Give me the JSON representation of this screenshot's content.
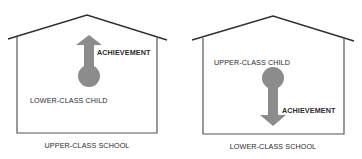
{
  "panels": [
    {
      "school_label": "UPPER-CLASS SCHOOL",
      "child_label": "LOWER-CLASS CHILD",
      "arrow_label": "ACHIEVEMENT",
      "arrow_direction": "up"
    },
    {
      "school_label": "LOWER-CLASS SCHOOL",
      "child_label": "UPPER-CLASS CHILD",
      "arrow_label": "ACHIEVEMENT",
      "arrow_direction": "down"
    }
  ],
  "colors": {
    "line": "#2f2f2f",
    "wall": "#555555",
    "arrow_fill": "#8c8c8c",
    "text": "#2a2a2a",
    "background": "#ffffff"
  }
}
